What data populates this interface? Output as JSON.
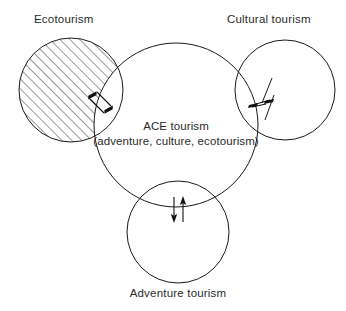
{
  "diagram": {
    "title_text": "ACE tourism",
    "subtitle_text": "(adventure, culture, ecotourism)",
    "background_color": "#ffffff",
    "stroke_color": "#1a1a1a",
    "text_color": "#2b2b2b",
    "labels": {
      "ecotourism": "Ecotourism",
      "cultural_tourism": "Cultural tourism",
      "adventure_tourism": "Adventure tourism"
    },
    "circles": [
      {
        "name": "ecotourism-circle",
        "label": "Ecotourism",
        "cx": 71,
        "cy": 90,
        "r": 52,
        "fill": "hatched",
        "hatch_angle_degrees": 45,
        "hatch_spacing_px": 7
      },
      {
        "name": "cultural-tourism-circle",
        "label": "Cultural tourism",
        "cx": 285,
        "cy": 90,
        "r": 50,
        "fill": "none"
      },
      {
        "name": "ace-tourism-circle",
        "label": "ACE tourism",
        "cx": 176,
        "cy": 125,
        "r": 82,
        "fill": "none"
      },
      {
        "name": "adventure-tourism-circle",
        "label": "Adventure tourism",
        "cx": 178,
        "cy": 232,
        "r": 51,
        "fill": "none"
      }
    ],
    "arrow_pairs": [
      {
        "name": "ecotourism-exchange-arrows",
        "between": [
          "Ecotourism",
          "ACE tourism"
        ],
        "direction": "bidirectional",
        "orientation": "diagonal-45"
      },
      {
        "name": "cultural-exchange-arrows",
        "between": [
          "ACE tourism",
          "Cultural tourism"
        ],
        "direction": "bidirectional",
        "orientation": "horizontal"
      },
      {
        "name": "adventure-exchange-arrows",
        "between": [
          "ACE tourism",
          "Adventure tourism"
        ],
        "direction": "bidirectional",
        "orientation": "vertical"
      }
    ]
  }
}
